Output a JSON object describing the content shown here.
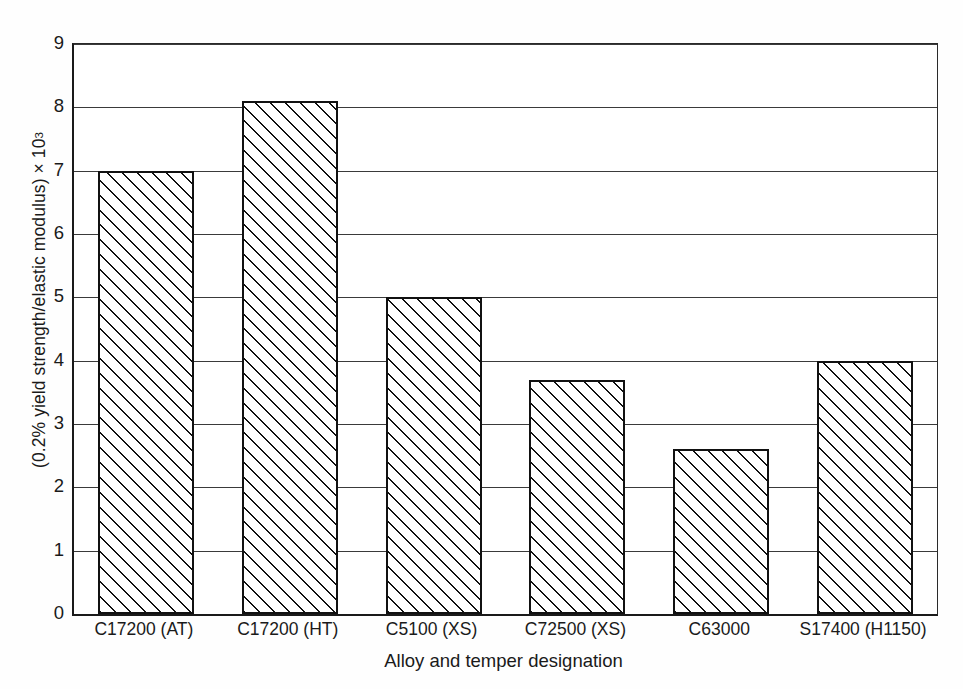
{
  "chart_data": {
    "type": "bar",
    "title": "",
    "categories": [
      "C17200 (AT)",
      "C17200 (HT)",
      "C5100 (XS)",
      "C72500 (XS)",
      "C63000",
      "S17400 (H1150)"
    ],
    "values": [
      7.0,
      8.1,
      5.0,
      3.7,
      2.6,
      4.0
    ],
    "xlabel": "Alloy and temper designation",
    "ylabel": "(0.2% yield strength/elastic modulus) × 10",
    "ylabel_exponent": "3",
    "ylim": [
      0,
      9
    ],
    "yticks": [
      0,
      1,
      2,
      3,
      4,
      5,
      6,
      7,
      8,
      9
    ],
    "ytick_labels": [
      "0",
      "1",
      "2",
      "3",
      "4",
      "5",
      "6",
      "7",
      "8",
      "9"
    ],
    "grid": "horizontal",
    "legend": "none",
    "bar_fill": "diagonal-hatch",
    "bar_edge_color": "#111111",
    "grid_color": "#3a3a3a",
    "background_color": "#ffffff"
  }
}
